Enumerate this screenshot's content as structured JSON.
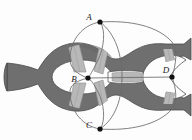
{
  "figure": {
    "background_color": "#fdfdfd",
    "surface_color": "#6f6f6f",
    "surface_shadow_color": "#5e5e5e",
    "band_color": "#b8b8b8",
    "band_edge_color": "#8e8e8e",
    "hole_color": "#fdfdfd",
    "outline_color": "#4a4a4a",
    "curve_color": "#6a6a6a",
    "point_color": "#111111"
  },
  "points": [
    {
      "id": "A",
      "label": "A",
      "x": 100,
      "y": 22,
      "label_x": 89,
      "label_y": 20
    },
    {
      "id": "B",
      "label": "B",
      "x": 88,
      "y": 78,
      "label_x": 74,
      "label_y": 82
    },
    {
      "id": "C",
      "label": "C",
      "x": 100,
      "y": 129,
      "label_x": 89,
      "label_y": 128
    },
    {
      "id": "D",
      "label": "D",
      "x": 172,
      "y": 77,
      "label_x": 164,
      "label_y": 73
    }
  ],
  "bands": [
    {
      "id": "band-upper-left",
      "name": "upper-left-band"
    },
    {
      "id": "band-upper-mid",
      "name": "upper-middle-band"
    },
    {
      "id": "band-lower-left",
      "name": "lower-left-band"
    },
    {
      "id": "band-lower-mid",
      "name": "lower-middle-band"
    },
    {
      "id": "band-center",
      "name": "center-neck-band"
    },
    {
      "id": "band-upper-right",
      "name": "upper-right-band"
    },
    {
      "id": "band-lower-right",
      "name": "lower-right-band"
    }
  ],
  "arcs": [
    {
      "id": "arc-a-b-left",
      "name": "arc-A-to-B-left"
    },
    {
      "id": "arc-a-b-right",
      "name": "arc-A-to-B-right"
    },
    {
      "id": "arc-c-b-left",
      "name": "arc-C-to-B-left"
    },
    {
      "id": "arc-c-b-right",
      "name": "arc-C-to-B-right"
    },
    {
      "id": "arc-a-d-outer",
      "name": "arc-A-to-D-outer"
    },
    {
      "id": "arc-c-d-outer",
      "name": "arc-C-to-D-outer"
    },
    {
      "id": "arc-b-d-straight",
      "name": "arc-B-to-D-straight"
    },
    {
      "id": "arc-a-c-right",
      "name": "arc-A-to-C-right"
    }
  ]
}
